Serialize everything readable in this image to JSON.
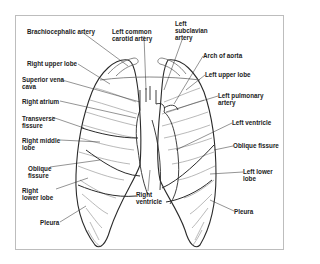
{
  "diagram": {
    "labels_left": [
      {
        "id": "brachiocephalic-artery",
        "text": "Brachiocephalic artery",
        "x": 27,
        "y": 28
      },
      {
        "id": "right-upper-lobe",
        "text": "Right upper lobe",
        "x": 27,
        "y": 60
      },
      {
        "id": "superior-vena-cava",
        "text": "Superior vena\ncava",
        "x": 22,
        "y": 76
      },
      {
        "id": "right-atrium",
        "text": "Right atrium",
        "x": 22,
        "y": 98
      },
      {
        "id": "transverse-fissure",
        "text": "Transverse\nfissure",
        "x": 22,
        "y": 115
      },
      {
        "id": "right-middle-lobe",
        "text": "Right middle\nlobe",
        "x": 22,
        "y": 137
      },
      {
        "id": "oblique-fissure-right",
        "text": "Oblique\nfissure",
        "x": 28,
        "y": 165
      },
      {
        "id": "right-lower-lobe",
        "text": "Right\nlower lobe",
        "x": 22,
        "y": 187
      },
      {
        "id": "pleura-right",
        "text": "Pleura",
        "x": 40,
        "y": 219
      }
    ],
    "labels_top": [
      {
        "id": "left-common-carotid-artery",
        "text": "Left common\ncarotid artery",
        "x": 112,
        "y": 28
      },
      {
        "id": "left-subclavian-artery",
        "text": "Left\nsubclavian\nartery",
        "x": 175,
        "y": 20
      }
    ],
    "labels_right": [
      {
        "id": "arch-of-aorta",
        "text": "Arch of aorta",
        "x": 203,
        "y": 52
      },
      {
        "id": "left-upper-lobe",
        "text": "Left upper lobe",
        "x": 205,
        "y": 71
      },
      {
        "id": "left-pulmonary-artery",
        "text": "Left pulmonary\nartery",
        "x": 218,
        "y": 92
      },
      {
        "id": "left-ventricle",
        "text": "Left ventricle",
        "x": 232,
        "y": 119
      },
      {
        "id": "oblique-fissure-left",
        "text": "Oblique fissure",
        "x": 233,
        "y": 142
      },
      {
        "id": "left-lower-lobe",
        "text": "Left lower\nlobe",
        "x": 243,
        "y": 168
      },
      {
        "id": "pleura-left",
        "text": "Pleura",
        "x": 234,
        "y": 208
      }
    ],
    "labels_bottom": [
      {
        "id": "right-ventricle",
        "text": "Right\nventricle",
        "x": 136,
        "y": 191
      }
    ],
    "colors": {
      "line": "#2a2a2a",
      "thin": "#8a8a8a",
      "frame": "#bdbdbd",
      "text": "#222222"
    }
  }
}
